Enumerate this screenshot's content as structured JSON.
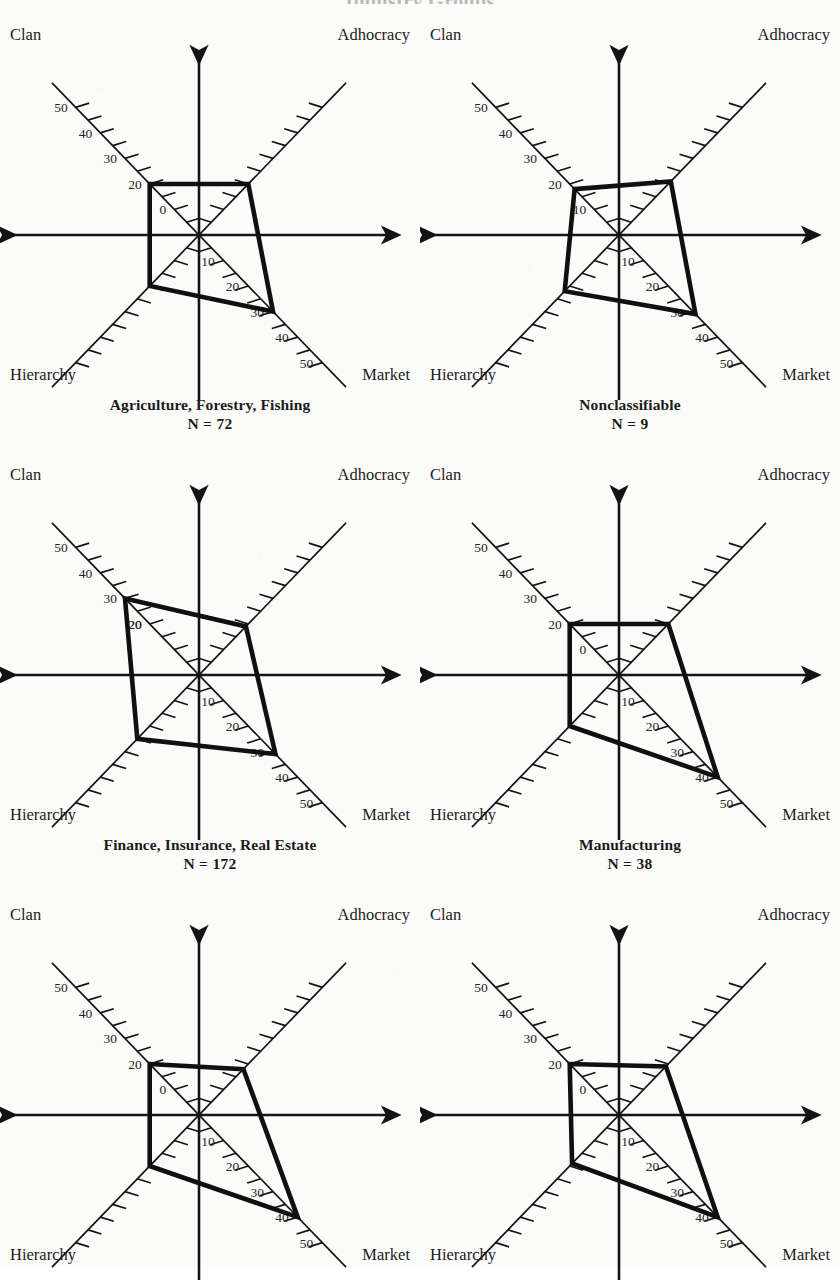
{
  "page": {
    "title": "Industry Groups",
    "background_color": "#fbfbf9",
    "ink_color": "#141414"
  },
  "axes": {
    "top_left": "Clan",
    "top_right": "Adhocracy",
    "bottom_left": "Hierarchy",
    "bottom_right": "Market",
    "tick_labels_outer": [
      "50",
      "40",
      "30",
      "20"
    ],
    "tick_labels_inner_clan": "0",
    "tick_labels_inner_market": [
      "10",
      "20",
      "30"
    ],
    "tick_labels_market_outer": [
      "40",
      "50"
    ],
    "scale_min": 0,
    "scale_max": 50,
    "tick_step": 5,
    "labeled_tick_step": 10
  },
  "charts": [
    {
      "id": "agriculture-forestry-fishing",
      "title": "Agriculture, Forestry, Fishing",
      "n_label": "N = 72",
      "n": 72,
      "clan_tick_inner_label": "0",
      "market_inner_labels": [
        "10",
        "20",
        "30"
      ],
      "values": {
        "clan": 20,
        "adhocracy": 20,
        "market": 30,
        "hierarchy": 20
      }
    },
    {
      "id": "nonclassifiable",
      "title": "Nonclassifiable",
      "n_label": "N = 9",
      "n": 9,
      "clan_tick_inner_label": "10",
      "market_inner_labels": [
        "10",
        "20",
        "30"
      ],
      "values": {
        "clan": 18,
        "adhocracy": 21,
        "market": 31,
        "hierarchy": 22
      }
    },
    {
      "id": "finance-insurance-real-estate",
      "title": "Finance, Insurance, Real Estate",
      "n_label": "N = 172",
      "n": 172,
      "clan_tick_inner_label": "20",
      "market_inner_labels": [
        "10",
        "20",
        "30"
      ],
      "values": {
        "clan": 30,
        "adhocracy": 19,
        "market": 31,
        "hierarchy": 25
      }
    },
    {
      "id": "manufacturing",
      "title": "Manufacturing",
      "n_label": "N = 38",
      "n": 38,
      "clan_tick_inner_label": "0",
      "market_inner_labels": [
        "10",
        "20",
        "30"
      ],
      "values": {
        "clan": 20,
        "adhocracy": 20,
        "market": 40,
        "hierarchy": 20
      }
    },
    {
      "id": "chart-5",
      "title": "",
      "n_label": "",
      "n": null,
      "clan_tick_inner_label": "0",
      "market_inner_labels": [
        "10",
        "20",
        "30"
      ],
      "values": {
        "clan": 20,
        "adhocracy": 18,
        "market": 40,
        "hierarchy": 20
      }
    },
    {
      "id": "chart-6",
      "title": "",
      "n_label": "",
      "n": null,
      "clan_tick_inner_label": "0",
      "market_inner_labels": [
        "10",
        "20",
        "30"
      ],
      "values": {
        "clan": 20,
        "adhocracy": 19,
        "market": 40,
        "hierarchy": 19
      }
    }
  ],
  "chart_data": {
    "type": "radar",
    "title": "Industry Groups",
    "axes": [
      "Clan",
      "Adhocracy",
      "Market",
      "Hierarchy"
    ],
    "axis_directions": {
      "Clan": "upper-left",
      "Adhocracy": "upper-right",
      "Market": "lower-right",
      "Hierarchy": "lower-left"
    },
    "radial_range": [
      0,
      50
    ],
    "tick_step": 5,
    "labeled_ticks": [
      0,
      10,
      20,
      30,
      40,
      50
    ],
    "grid": false,
    "legend": "none",
    "panels": [
      {
        "name": "Agriculture, Forestry, Fishing",
        "annotation": "N = 72",
        "categories": [
          "Clan",
          "Adhocracy",
          "Market",
          "Hierarchy"
        ],
        "values": [
          20,
          20,
          30,
          20
        ]
      },
      {
        "name": "Nonclassifiable",
        "annotation": "N = 9",
        "categories": [
          "Clan",
          "Adhocracy",
          "Market",
          "Hierarchy"
        ],
        "values": [
          18,
          21,
          31,
          22
        ]
      },
      {
        "name": "Finance, Insurance, Real Estate",
        "annotation": "N = 172",
        "categories": [
          "Clan",
          "Adhocracy",
          "Market",
          "Hierarchy"
        ],
        "values": [
          30,
          19,
          31,
          25
        ]
      },
      {
        "name": "Manufacturing",
        "annotation": "N = 38",
        "categories": [
          "Clan",
          "Adhocracy",
          "Market",
          "Hierarchy"
        ],
        "values": [
          20,
          20,
          40,
          20
        ]
      },
      {
        "name": "",
        "annotation": "",
        "categories": [
          "Clan",
          "Adhocracy",
          "Market",
          "Hierarchy"
        ],
        "values": [
          20,
          18,
          40,
          20
        ]
      },
      {
        "name": "",
        "annotation": "",
        "categories": [
          "Clan",
          "Adhocracy",
          "Market",
          "Hierarchy"
        ],
        "values": [
          20,
          19,
          40,
          19
        ]
      }
    ]
  }
}
